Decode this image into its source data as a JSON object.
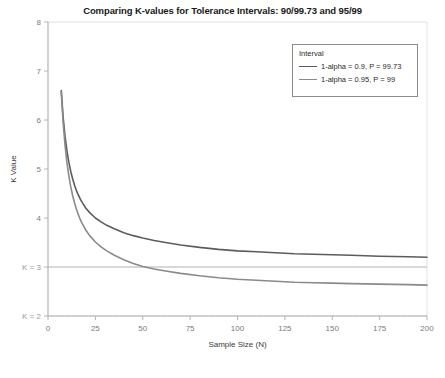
{
  "chart_data": {
    "type": "line",
    "title": "Comparing K-values for Tolerance Intervals: 90/99.73 and 95/99",
    "xlabel": "Sample Size (N)",
    "ylabel": "K Value",
    "xlim": [
      0,
      200
    ],
    "ylim": [
      2,
      8
    ],
    "xticks": [
      0,
      25,
      50,
      75,
      100,
      125,
      150,
      175,
      200
    ],
    "xtick_labels": [
      "0",
      "25",
      "50",
      "75",
      "100",
      "125",
      "150",
      "175",
      "200"
    ],
    "yticks": [
      2,
      3,
      4,
      5,
      6,
      7,
      8
    ],
    "ytick_labels": [
      "K = 2",
      "K = 3",
      "4",
      "5",
      "6",
      "7",
      "8"
    ],
    "grid": false,
    "legend_position": "upper right",
    "legend_title": "Interval",
    "reference_lines": [
      {
        "name": "k-equals-3-line",
        "value": 3,
        "label": "K = 3",
        "style": "solid",
        "color": "#b0b0b0"
      },
      {
        "name": "k-equals-2-line",
        "value": 2,
        "label": "K = 2",
        "style": "dotted",
        "color": "#c8c8c8"
      }
    ],
    "x": [
      7,
      8,
      9,
      10,
      11,
      12,
      13,
      14,
      15,
      16,
      17,
      18,
      20,
      22,
      25,
      28,
      31,
      35,
      40,
      45,
      50,
      56,
      62,
      70,
      80,
      90,
      100,
      110,
      120,
      130,
      140,
      150,
      160,
      175,
      190,
      200
    ],
    "series": [
      {
        "name": "1-alpha = 0.9, P = 99.73",
        "color": "#5c5c5c",
        "values": [
          6.6,
          6.05,
          5.66,
          5.37,
          5.14,
          4.95,
          4.8,
          4.67,
          4.56,
          4.47,
          4.39,
          4.32,
          4.2,
          4.11,
          4.0,
          3.92,
          3.85,
          3.78,
          3.7,
          3.64,
          3.59,
          3.54,
          3.5,
          3.45,
          3.4,
          3.36,
          3.33,
          3.31,
          3.29,
          3.27,
          3.26,
          3.25,
          3.24,
          3.22,
          3.21,
          3.2
        ]
      },
      {
        "name": "1-alpha = 0.95, P = 99",
        "color": "#8a8a8a",
        "values": [
          6.58,
          5.94,
          5.48,
          5.13,
          4.86,
          4.64,
          4.46,
          4.31,
          4.18,
          4.07,
          3.97,
          3.89,
          3.75,
          3.64,
          3.51,
          3.41,
          3.33,
          3.24,
          3.15,
          3.07,
          3.01,
          2.96,
          2.92,
          2.87,
          2.82,
          2.78,
          2.75,
          2.73,
          2.71,
          2.69,
          2.68,
          2.67,
          2.66,
          2.65,
          2.64,
          2.63
        ]
      }
    ]
  }
}
